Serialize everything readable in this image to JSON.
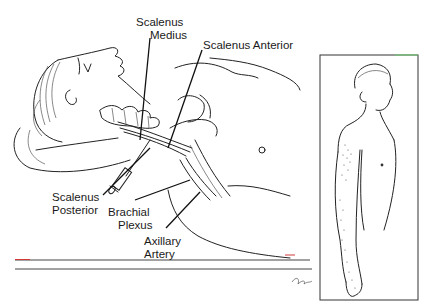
{
  "figure": {
    "main_panel": {
      "description": "Supine patient, head turned, needle inserted at interscalene groove",
      "labels": {
        "scalenus_medius": [
          "Scalenus",
          "Medius"
        ],
        "scalenus_anterior": "Scalenus Anterior",
        "scalenus_posterior": [
          "Scalenus",
          "Posterior"
        ],
        "brachial_plexus": [
          "Brachial",
          "Plexus"
        ],
        "axillary_artery": [
          "Axillary",
          "Artery"
        ]
      }
    },
    "inset_panel": {
      "description": "Standing figure showing stippled sensory distribution along arm"
    },
    "colors": {
      "ink": "#222222",
      "background": "#ffffff",
      "accent_red": "#d23a3a",
      "accent_green": "#6fcf6f"
    }
  }
}
